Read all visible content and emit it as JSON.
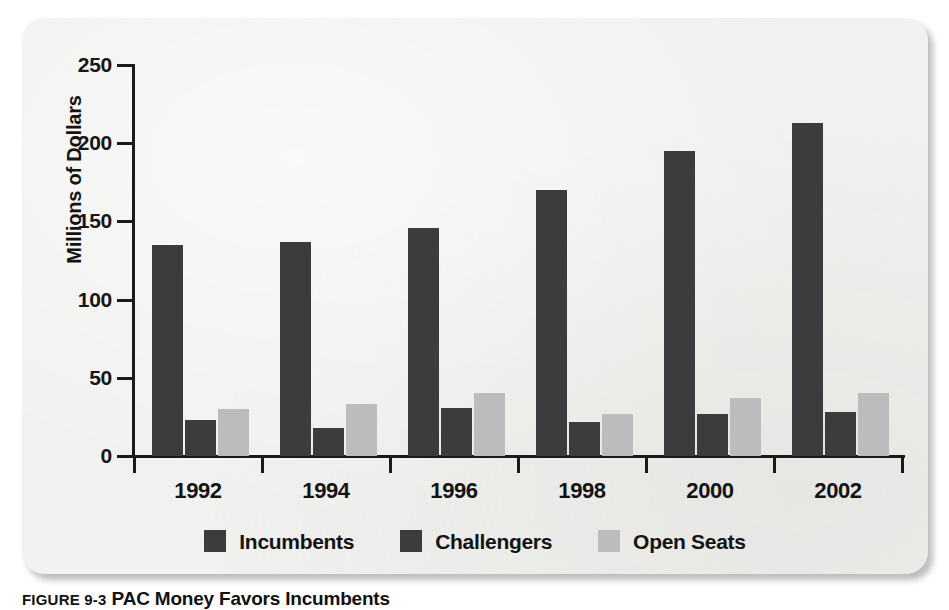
{
  "figure": {
    "caption_number": "FIGURE 9-3",
    "caption_title": "PAC Money Favors Incumbents"
  },
  "chart_data": {
    "type": "bar",
    "title": "",
    "xlabel": "",
    "ylabel": "Millions of Dollars",
    "categories": [
      "1992",
      "1994",
      "1996",
      "1998",
      "2000",
      "2002"
    ],
    "series": [
      {
        "name": "Incumbents",
        "color": "#3c3c3c",
        "values": [
          135,
          137,
          146,
          170,
          195,
          213
        ]
      },
      {
        "name": "Challengers",
        "color": "#3c3c3c",
        "values": [
          23,
          18,
          31,
          22,
          27,
          28
        ]
      },
      {
        "name": "Open Seats",
        "color": "#bcbcbc",
        "values": [
          30,
          33,
          40,
          27,
          37,
          40
        ]
      }
    ],
    "ylim": [
      0,
      250
    ],
    "ytick_labels": [
      "0",
      "50",
      "100",
      "150",
      "200",
      "250"
    ],
    "ytick_values": [
      0,
      50,
      100,
      150,
      200,
      250
    ],
    "grid": false,
    "legend_position": "bottom-center"
  },
  "panel": {
    "background_color": "#f1f1ef",
    "axis_color": "#1a1a1a"
  }
}
